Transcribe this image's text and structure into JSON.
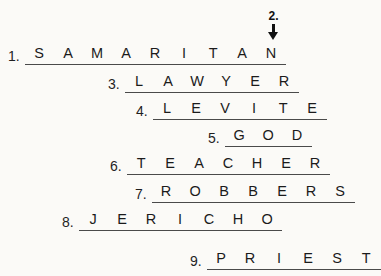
{
  "sheet": {
    "background_color": "#fbfaf7",
    "text_color": "#1b1b1b",
    "rule_color": "#4a4a4a"
  },
  "marker": {
    "label": "2.",
    "arrow_glyph": "down-arrow",
    "points_to_row": 1,
    "points_to_letter_index": 8,
    "points_to_letter": "N"
  },
  "rows": [
    {
      "number": "1.",
      "answer": "SAMARITAN",
      "letters": [
        "S",
        "A",
        "M",
        "A",
        "R",
        "I",
        "T",
        "A",
        "N"
      ],
      "left": 8,
      "top": 41
    },
    {
      "number": "3.",
      "answer": "LAWYER",
      "letters": [
        "L",
        "A",
        "W",
        "Y",
        "E",
        "R"
      ],
      "left": 108,
      "top": 69
    },
    {
      "number": "4.",
      "answer": "LEVITE",
      "letters": [
        "L",
        "E",
        "V",
        "I",
        "T",
        "E"
      ],
      "left": 136,
      "top": 96
    },
    {
      "number": "5.",
      "answer": "GOD",
      "letters": [
        "G",
        "O",
        "D"
      ],
      "left": 208,
      "top": 123
    },
    {
      "number": "6.",
      "answer": "TEACHER",
      "letters": [
        "T",
        "E",
        "A",
        "C",
        "H",
        "E",
        "R"
      ],
      "left": 110,
      "top": 151
    },
    {
      "number": "7.",
      "answer": "ROBBERS",
      "letters": [
        "R",
        "O",
        "B",
        "B",
        "E",
        "R",
        "S"
      ],
      "left": 135,
      "top": 179
    },
    {
      "number": "8.",
      "answer": "JERICHO",
      "letters": [
        "J",
        "E",
        "R",
        "I",
        "C",
        "H",
        "O"
      ],
      "left": 62,
      "top": 207
    },
    {
      "number": "9.",
      "answer": "PRIEST",
      "letters": [
        "P",
        "R",
        "I",
        "E",
        "S",
        "T"
      ],
      "left": 190,
      "top": 246
    }
  ]
}
